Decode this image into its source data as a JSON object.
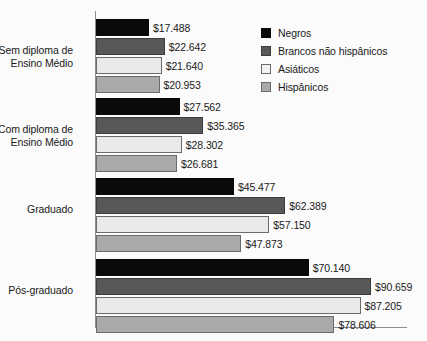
{
  "chart_data": {
    "type": "bar",
    "orientation": "horizontal",
    "title": "",
    "xlabel": "",
    "ylabel": "",
    "grid": false,
    "legend_position": "top-right",
    "xlim": [
      0,
      102000
    ],
    "categories": [
      "Sem diploma de\nEnsino Médio",
      "Com diploma de\nEnsino Médio",
      "Graduado",
      "Pós-graduado"
    ],
    "series": [
      {
        "name": "Negros",
        "color": "#0a0a0a",
        "values": [
          17488,
          27562,
          45477,
          70140
        ],
        "labels": [
          "$17.488",
          "$27.562",
          "$45.477",
          "$70.140"
        ]
      },
      {
        "name": "Brancos não hispânicos",
        "color": "#585858",
        "values": [
          22642,
          35365,
          62389,
          90659
        ],
        "labels": [
          "$22.642",
          "$35.365",
          "$62.389",
          "$90.659"
        ]
      },
      {
        "name": "Asiáticos",
        "color": "#e9e9e9",
        "values": [
          21640,
          28302,
          57150,
          87205
        ],
        "labels": [
          "$21.640",
          "$28.302",
          "$57.150",
          "$87.205"
        ]
      },
      {
        "name": "Hispânicos",
        "color": "#a9a9a9",
        "values": [
          20953,
          26681,
          47873,
          78606
        ],
        "labels": [
          "$20.953",
          "$26.681",
          "$47.873",
          "$78.606"
        ]
      }
    ]
  },
  "legend": {
    "items": [
      {
        "label": "Negros",
        "swatch": "legend-swatch-negros"
      },
      {
        "label": "Brancos não hispânicos",
        "swatch": "legend-swatch-brancos-nao-hispanicos"
      },
      {
        "label": "Asiáticos",
        "swatch": "legend-swatch-asiaticos"
      },
      {
        "label": "Hispânicos",
        "swatch": "legend-swatch-hispanicos"
      }
    ]
  }
}
